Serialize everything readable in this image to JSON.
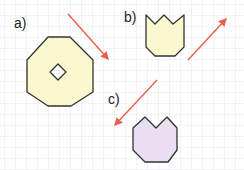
{
  "diagram": {
    "grid": {
      "spacing": 11,
      "color": "#dcdce6"
    },
    "colors": {
      "arrow": "#e8604a",
      "outline": "#333333",
      "yellow_fill": "#fbf8cf",
      "purple_fill": "#eadff0"
    },
    "parts": [
      {
        "id": "a",
        "label": "a)",
        "shape": "octagon-with-diamond-hole",
        "arrow_direction": "down-right"
      },
      {
        "id": "b",
        "label": "b)",
        "shape": "tulip-three-points",
        "arrow_direction": "up-right"
      },
      {
        "id": "c",
        "label": "c)",
        "shape": "tulip-two-points",
        "arrow_direction": "down-left"
      }
    ]
  }
}
